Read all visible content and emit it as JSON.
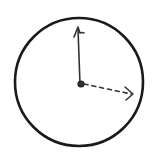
{
  "diagram": {
    "type": "hand-drawn vector diagram",
    "elements": [
      {
        "name": "circle",
        "cx": 79,
        "cy": 82,
        "r": 65,
        "stroke": "#1a1a1a"
      },
      {
        "name": "origin-point",
        "cx": 80,
        "cy": 84
      },
      {
        "name": "solid-vector",
        "from": [
          80,
          84
        ],
        "to": [
          77,
          28
        ],
        "style": "solid"
      },
      {
        "name": "dashed-vector",
        "from": [
          80,
          84
        ],
        "to": [
          133,
          95
        ],
        "style": "dashed"
      }
    ],
    "colors": {
      "stroke": "#1a1a1a",
      "background": "#ffffff"
    }
  }
}
